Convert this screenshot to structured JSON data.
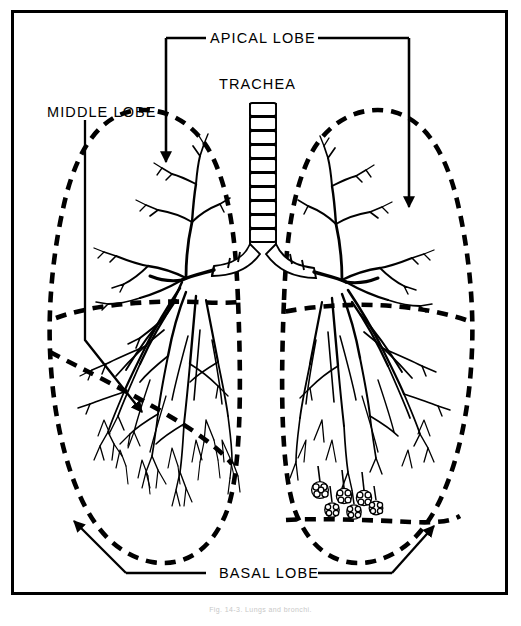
{
  "figure": {
    "caption": "Fig. 14-3. Lungs and bronchi.",
    "frame_color": "#000000",
    "background_color": "#ffffff",
    "line_color": "#000000",
    "dashed_boundary_style": "thick dashed"
  },
  "labels": {
    "apical_lobe": "APICAL LOBE",
    "trachea": "TRACHEA",
    "middle_lobe": "MIDDLE LOBE",
    "basal_lobe": "BASAL LOBE"
  },
  "structures": {
    "trachea_rings": 11,
    "lungs": [
      "left lung",
      "right lung"
    ],
    "lobes": [
      "apical lobe",
      "middle lobe",
      "basal lobe"
    ],
    "alveolar_sacs": "grape-like clusters at right basal lobe terminal bronchioles"
  },
  "leaders": {
    "apical_left_arrow": "arrow into left apical lobe",
    "apical_right_arrow": "arrow into right apical lobe",
    "middle_lobe_arrow": "arrow into middle lobe",
    "basal_left_arrow": "arrow into left basal lobe",
    "basal_right_arrow": "arrow into right basal lobe"
  }
}
